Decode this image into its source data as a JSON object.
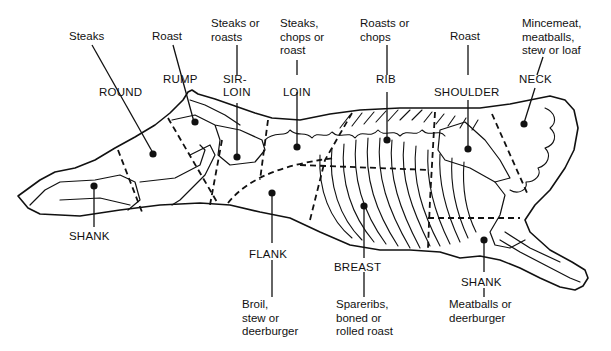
{
  "cuts": [
    {
      "id": "round",
      "name": "ROUND",
      "use": "Steaks"
    },
    {
      "id": "rump",
      "name": "RUMP",
      "use": "Roast"
    },
    {
      "id": "sirloin",
      "name": "SIR-\nLOIN",
      "use": "Steaks or\nroasts"
    },
    {
      "id": "loin",
      "name": "LOIN",
      "use": "Steaks,\nchops or\nroast"
    },
    {
      "id": "rib",
      "name": "RIB",
      "use": "Roasts or\nchops"
    },
    {
      "id": "shoulder",
      "name": "SHOULDER",
      "use": "Roast"
    },
    {
      "id": "neck",
      "name": "NECK",
      "use": "Mincemeat,\nmeatballs,\nstew or loaf"
    },
    {
      "id": "hind-shank",
      "name": "SHANK",
      "use": ""
    },
    {
      "id": "flank",
      "name": "FLANK",
      "use": "Broil,\nstew or\ndeerburger"
    },
    {
      "id": "breast",
      "name": "BREAST",
      "use": "Spareribs,\nboned or\nrolled roast"
    },
    {
      "id": "fore-shank",
      "name": "SHANK",
      "use": "Meatballs or\ndeerburger"
    }
  ],
  "colors": {
    "ink": "#111111",
    "background": "#ffffff"
  }
}
